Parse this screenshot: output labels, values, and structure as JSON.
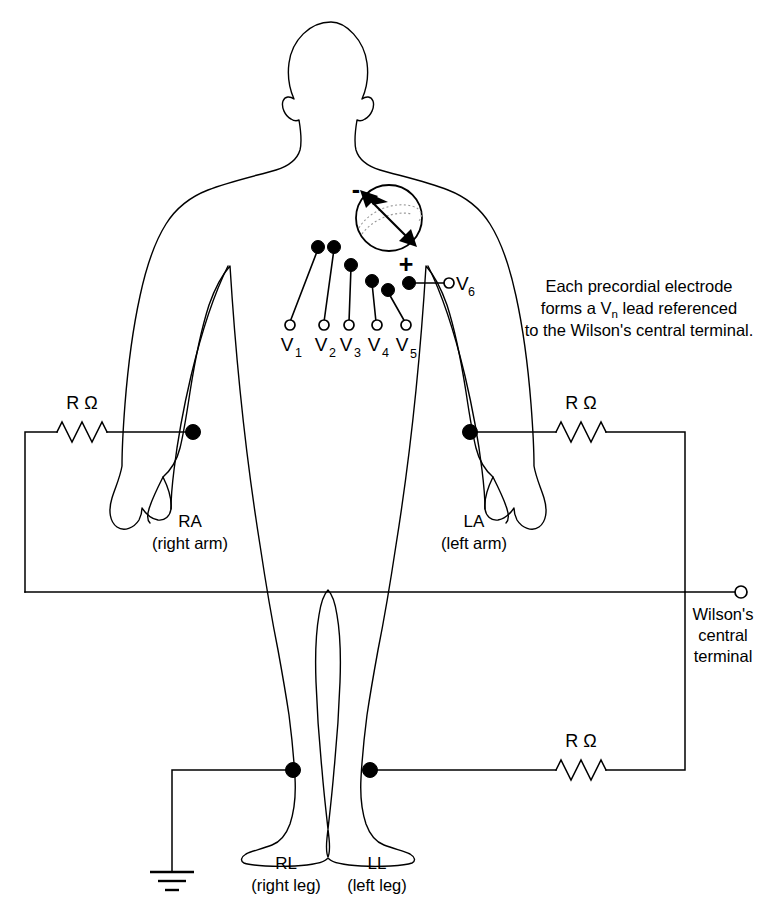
{
  "diagram": {
    "annotation": {
      "line1": "Each precordial electrode",
      "line2_a": "forms a V",
      "line2_sub": "n",
      "line2_b": " lead referenced",
      "line3": "to the Wilson's central terminal."
    },
    "heart": {
      "negative_sign": "-",
      "positive_sign": "+"
    },
    "precordial_leads": [
      {
        "name": "V",
        "subscript": "1"
      },
      {
        "name": "V",
        "subscript": "2"
      },
      {
        "name": "V",
        "subscript": "3"
      },
      {
        "name": "V",
        "subscript": "4"
      },
      {
        "name": "V",
        "subscript": "5"
      },
      {
        "name": "V",
        "subscript": "6"
      }
    ],
    "limb_electrodes": [
      {
        "code": "RA",
        "description": "(right arm)"
      },
      {
        "code": "LA",
        "description": "(left arm)"
      },
      {
        "code": "RL",
        "description": "(right leg)"
      },
      {
        "code": "LL",
        "description": "(left leg)"
      }
    ],
    "resistors": [
      {
        "label": "R Ω"
      },
      {
        "label": "R Ω"
      },
      {
        "label": "R Ω"
      }
    ],
    "wilson_terminal": {
      "line1": "Wilson's",
      "line2": "central",
      "line3": "terminal"
    },
    "colors": {
      "stroke": "#000000",
      "background": "#ffffff",
      "hatch": "#999999"
    }
  }
}
